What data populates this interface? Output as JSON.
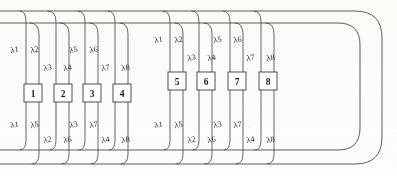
{
  "figure": {
    "background_color": "#fdfdfc",
    "line_color": "#4a4a4a",
    "text_color": "#2a2a2a"
  },
  "buses": [
    {
      "name": "upper-outer-bus",
      "y": 11
    },
    {
      "name": "upper-inner-bus",
      "y": 23
    },
    {
      "name": "lower-inner-bus",
      "y": 150
    },
    {
      "name": "lower-outer-bus",
      "y": 164
    }
  ],
  "nodes": [
    {
      "label": "1",
      "x": 35,
      "y": 93,
      "group": "left",
      "upper_labels": [
        "λ1",
        "λ2"
      ],
      "lower_labels": [
        "λ1",
        "λ5"
      ]
    },
    {
      "label": "2",
      "x": 65,
      "y": 93,
      "group": "left",
      "upper_labels": [
        "λ3",
        "λ4"
      ],
      "lower_labels": [
        "λ2",
        "λ6"
      ]
    },
    {
      "label": "3",
      "x": 93,
      "y": 93,
      "group": "left",
      "upper_labels": [
        "λ5",
        "λ6"
      ],
      "lower_labels": [
        "λ3",
        "λ7"
      ]
    },
    {
      "label": "4",
      "x": 123,
      "y": 93,
      "group": "left",
      "upper_labels": [
        "λ7",
        "λ8"
      ],
      "lower_labels": [
        "λ4",
        "λ8"
      ]
    },
    {
      "label": "5",
      "x": 178,
      "y": 81,
      "group": "right",
      "upper_labels": [
        "λ1",
        "λ2"
      ],
      "lower_labels": [
        "λ1",
        "λ5"
      ]
    },
    {
      "label": "6",
      "x": 207,
      "y": 81,
      "group": "right",
      "upper_labels": [
        "λ3",
        "λ4"
      ],
      "lower_labels": [
        "λ2",
        "λ6"
      ]
    },
    {
      "label": "7",
      "x": 238,
      "y": 81,
      "group": "right",
      "upper_labels": [
        "λ5",
        "λ6"
      ],
      "lower_labels": [
        "λ3",
        "λ7"
      ]
    },
    {
      "label": "8",
      "x": 269,
      "y": 81,
      "group": "right",
      "upper_labels": [
        "λ7",
        "λ8"
      ],
      "lower_labels": [
        "λ4",
        "λ8"
      ]
    }
  ],
  "wavelength_labels": {
    "top_left_row_high": [
      "λ1",
      "λ2",
      "λ5",
      "λ6"
    ],
    "top_left_row_low": [
      "λ3",
      "λ4",
      "λ7",
      "λ8"
    ],
    "top_right_row_high": [
      "λ1",
      "λ2",
      "λ5",
      "λ6"
    ],
    "top_right_row_low": [
      "λ3",
      "λ4",
      "λ7",
      "λ8"
    ],
    "bottom_left_row_high": [
      "λ1",
      "λ5",
      "λ3",
      "λ7"
    ],
    "bottom_left_row_low": [
      "λ2",
      "λ6",
      "λ4",
      "λ8"
    ],
    "bottom_right_row_high": [
      "λ1",
      "λ5",
      "λ3",
      "λ7"
    ],
    "bottom_right_row_low": [
      "λ2",
      "λ6",
      "λ4",
      "λ8"
    ]
  },
  "annotations": {
    "lambda_glyph": "λ",
    "subscripts": [
      "1",
      "2",
      "3",
      "4",
      "5",
      "6",
      "7",
      "8"
    ]
  }
}
